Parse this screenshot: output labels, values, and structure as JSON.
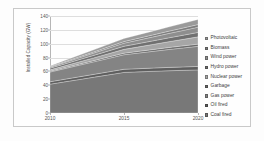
{
  "chart_data": {
    "type": "area",
    "stacked": true,
    "title": "",
    "xlabel": "",
    "ylabel": "Installed Capacity (GW)",
    "x": [
      2010,
      2011,
      2012,
      2013,
      2014,
      2015,
      2016,
      2017,
      2018,
      2019,
      2020
    ],
    "xlim": [
      2010,
      2020
    ],
    "xticks": [
      "2010",
      "2015",
      "2020"
    ],
    "xtick_values": [
      2010,
      2015,
      2020
    ],
    "ylim": [
      0,
      140
    ],
    "yticks": [
      "0",
      "20",
      "40",
      "60",
      "80",
      "100",
      "120",
      "140"
    ],
    "ytick_values": [
      0,
      20,
      40,
      60,
      80,
      100,
      120,
      140
    ],
    "grid": true,
    "legend_position": "right",
    "stack_order_bottom_to_top": [
      "Coal fired",
      "Oil fired",
      "Gas power",
      "Garbage",
      "Nuclear power",
      "Hydro power",
      "Wind power",
      "Biomass",
      "Photovoltaic"
    ],
    "series": [
      {
        "name": "Photovoltaic",
        "color": "#9a9a9a",
        "values": [
          1.0,
          1.6,
          2.3,
          3.0,
          3.7,
          4.4,
          5.0,
          5.6,
          6.2,
          6.8,
          7.4
        ]
      },
      {
        "name": "Biomass",
        "color": "#7d7d7d",
        "values": [
          0.8,
          1.1,
          1.4,
          1.7,
          2.0,
          2.3,
          2.6,
          2.9,
          3.2,
          3.5,
          3.8
        ]
      },
      {
        "name": "Wind power",
        "color": "#8e8e8e",
        "values": [
          1.5,
          2.1,
          2.7,
          3.3,
          3.9,
          4.5,
          5.1,
          5.7,
          6.3,
          6.9,
          7.5
        ]
      },
      {
        "name": "Hydro power",
        "color": "#707070",
        "values": [
          2.4,
          2.8,
          3.2,
          3.6,
          4.0,
          4.4,
          4.8,
          5.2,
          5.6,
          6.0,
          6.4
        ]
      },
      {
        "name": "Nuclear power",
        "color": "#a6a6a6",
        "values": [
          2.0,
          2.6,
          3.3,
          4.0,
          4.8,
          5.6,
          6.5,
          7.4,
          8.4,
          9.4,
          10.5
        ]
      },
      {
        "name": "Garbage",
        "color": "#6a6a6a",
        "values": [
          1.2,
          1.4,
          1.6,
          1.8,
          2.0,
          2.2,
          2.4,
          2.6,
          2.8,
          3.0,
          3.2
        ]
      },
      {
        "name": "Gas power",
        "color": "#848484",
        "values": [
          14.0,
          15.4,
          16.8,
          18.2,
          19.6,
          21.0,
          22.6,
          24.2,
          25.8,
          27.4,
          29.0
        ]
      },
      {
        "name": "Oil fired",
        "color": "#5e5e5e",
        "values": [
          3.5,
          3.7,
          3.9,
          4.1,
          4.3,
          4.5,
          4.6,
          4.7,
          4.8,
          4.9,
          5.0
        ]
      },
      {
        "name": "Coal fired",
        "color": "#787878",
        "values": [
          41.6,
          45.0,
          48.4,
          51.8,
          55.2,
          58.6,
          59.4,
          60.2,
          61.0,
          61.6,
          62.2
        ]
      }
    ],
    "totals": [
      68.0,
      75.7,
      83.6,
      91.5,
      99.5,
      107.5,
      113.0,
      118.5,
      124.1,
      129.5,
      135.0
    ],
    "totals_note": "Stack top rises from about 68 GW in 2010 to about 124 GW in 2020"
  },
  "legend": {
    "items": [
      {
        "label": "Photovoltaic",
        "color": "#9a9a9a"
      },
      {
        "label": "Biomass",
        "color": "#7d7d7d"
      },
      {
        "label": "Wind power",
        "color": "#8e8e8e"
      },
      {
        "label": "Hydro power",
        "color": "#707070"
      },
      {
        "label": "Nuclear power",
        "color": "#a6a6a6"
      },
      {
        "label": "Garbage",
        "color": "#6a6a6a"
      },
      {
        "label": "Gas power",
        "color": "#848484"
      },
      {
        "label": "Oil fired",
        "color": "#5e5e5e"
      },
      {
        "label": "Coal fired",
        "color": "#787878"
      }
    ]
  }
}
